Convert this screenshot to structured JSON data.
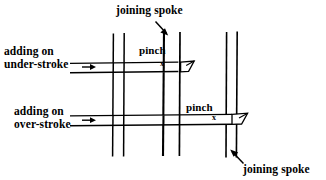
{
  "diagram": {
    "title_text": "basket weaving joining spoke diagram",
    "ink_color": "#000000",
    "background_color": "#ffffff",
    "labels": {
      "joining_spoke_top": "joining spoke",
      "joining_spoke_bottom": "joining spoke",
      "adding_on_under_stroke": "adding on\nunder-stroke",
      "adding_on_over_stroke": "adding on\nover-stroke",
      "pinch_top": "pinch",
      "pinch_bottom": "pinch",
      "x_mark_top": "x",
      "x_mark_bottom": "x"
    },
    "elements": {
      "spoke_pair_left": "vertical spoke pair left",
      "spoke_pair_center": "vertical joining spoke pair center",
      "spoke_pair_right": "vertical joining spoke pair right",
      "weaver_upper": "horizontal weaver upper under-stroke",
      "weaver_lower": "horizontal weaver lower over-stroke",
      "arrow_joining_spoke_top": "arrow pointing down-right to center spoke",
      "arrow_joining_spoke_bottom": "arrow pointing up-left to right spoke",
      "arrow_adding_under": "arrow pointing right to upper weaver",
      "arrow_adding_over": "arrow pointing right to lower weaver",
      "tip_upper": "beveled cut end of upper weaver",
      "tip_lower": "beveled cut end of lower weaver"
    }
  }
}
